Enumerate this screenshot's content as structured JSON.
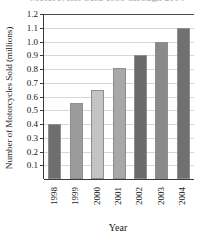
{
  "chart_data": {
    "type": "bar",
    "title": "Motorcycles Sold 1998 through 2004",
    "xlabel": "Year",
    "ylabel": "Number of Motorcycles Sold (millions)",
    "categories": [
      "1998",
      "1999",
      "2000",
      "2001",
      "2002",
      "2003",
      "2004"
    ],
    "values": [
      0.4,
      0.55,
      0.65,
      0.81,
      0.9,
      1.0,
      1.1
    ],
    "ylim": [
      0,
      1.2
    ],
    "ytick_labels": [
      "0.1",
      "0.2",
      "0.3",
      "0.4",
      "0.5",
      "0.6",
      "0.7",
      "0.8",
      "0.9",
      "1.0",
      "1.1",
      "1.2"
    ],
    "ytick_values": [
      0.1,
      0.2,
      0.3,
      0.4,
      0.5,
      0.6,
      0.7,
      0.8,
      0.9,
      1.0,
      1.1,
      1.2
    ],
    "grid": true,
    "legend": "none",
    "bar_colors": [
      "#6e6e6e",
      "#9b9b9b",
      "#c4c4c4",
      "#a8a8a8",
      "#6b6b6b",
      "#8a8a8a",
      "#707070"
    ],
    "grid_color": "#d8d8d8",
    "axis_color": "#3a3a3a"
  }
}
